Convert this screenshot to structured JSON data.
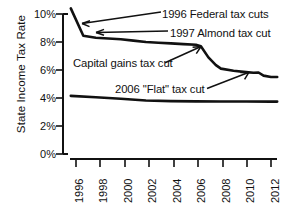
{
  "chart_data": {
    "type": "line",
    "title": "",
    "subtitle": "",
    "xlabel": "",
    "ylabel": "State Income Tax Rate",
    "xlim": [
      1996,
      2012.6
    ],
    "ylim": [
      0,
      10.8
    ],
    "grid": false,
    "legend_position": "none",
    "y_ticks": [
      "0%",
      "2%",
      "4%",
      "6%",
      "8%",
      "10%"
    ],
    "y_tick_values": [
      0,
      2,
      4,
      6,
      8,
      10
    ],
    "x_ticks": [
      "1996",
      "1998",
      "2000",
      "2002",
      "2004",
      "2006",
      "2008",
      "2010",
      "2012"
    ],
    "x_tick_values": [
      1996,
      1998,
      2000,
      2002,
      2004,
      2006,
      2008,
      2010,
      2012
    ],
    "series": [
      {
        "name": "top-tax-rate",
        "color": "#111111",
        "x": [
          1996,
          1997,
          1998,
          1999,
          2000,
          2001,
          2002,
          2003,
          2004,
          2005,
          2006,
          2006.4,
          2007,
          2007.6,
          2008,
          2009,
          2010,
          2010.6,
          2011,
          2011.4,
          2012,
          2012.5
        ],
        "values": [
          10.4,
          8.45,
          8.3,
          8.25,
          8.2,
          8.1,
          8.0,
          7.95,
          7.9,
          7.85,
          7.8,
          7.7,
          6.9,
          6.35,
          6.1,
          5.95,
          5.85,
          5.8,
          5.82,
          5.6,
          5.5,
          5.5
        ]
      },
      {
        "name": "flat-tax-rate",
        "color": "#111111",
        "x": [
          1996,
          1998,
          2000,
          2002,
          2004,
          2006,
          2008,
          2010,
          2012,
          2012.5
        ],
        "values": [
          4.15,
          4.05,
          3.95,
          3.82,
          3.78,
          3.76,
          3.75,
          3.75,
          3.74,
          3.74
        ]
      }
    ],
    "annotations": [
      {
        "name": "annotation-1996-federal",
        "text": "1996 Federal tax cuts",
        "target_x": 1996.6,
        "target_y": 9.4
      },
      {
        "name": "annotation-1997-almond",
        "text": "1997 Almond tax cut",
        "target_x": 1997.3,
        "target_y": 8.4
      },
      {
        "name": "annotation-capital-gains",
        "text": "Capital gains tax cut",
        "target_x": 2006.2,
        "target_y": 7.75
      },
      {
        "name": "annotation-flat-tax",
        "text": "2006 \"Flat\" tax cut",
        "target_x": 2010.5,
        "target_y": 5.8
      }
    ]
  }
}
